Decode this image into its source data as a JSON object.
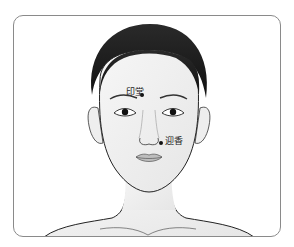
{
  "diagram": {
    "frame_color": "#8a8a8a",
    "points": [
      {
        "label": "印堂",
        "name": "yintang",
        "dot": {
          "x": 142,
          "y": 95
        },
        "label_pos": {
          "x": 126,
          "y": 88
        }
      },
      {
        "label": "迎香",
        "name": "yingxiang",
        "dot": {
          "x": 161,
          "y": 143
        },
        "label_pos": {
          "x": 165,
          "y": 137
        }
      }
    ]
  }
}
